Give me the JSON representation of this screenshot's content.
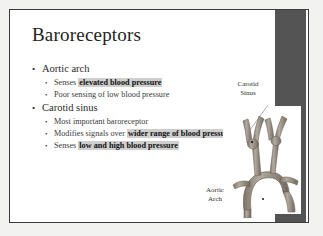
{
  "slide": {
    "title": "Baroreceptors",
    "bullets": [
      {
        "level": 1,
        "marker": "•",
        "text": "Aortic arch"
      },
      {
        "level": 2,
        "marker": "•",
        "lead": "Senses ",
        "highlight": "elevated blood  pressure",
        "tail": ""
      },
      {
        "level": 2,
        "marker": "•",
        "lead": "Poor sensing  of low blood pressure",
        "highlight": "",
        "tail": ""
      },
      {
        "level": 1,
        "marker": "•",
        "text": "Carotid sinus"
      },
      {
        "level": 2,
        "marker": "•",
        "lead": "Most important  baroreceptor",
        "highlight": "",
        "tail": ""
      },
      {
        "level": 2,
        "marker": "•",
        "lead": "Modifies signals over ",
        "highlight": "wider range of blood  pressure",
        "tail": ""
      },
      {
        "level": 2,
        "marker": "•",
        "lead": "Senses ",
        "highlight": "low and high blood  pressure",
        "tail": ""
      }
    ],
    "figure": {
      "name": "aortic-arch-carotid-anatomy-illustration",
      "labels": {
        "carotid_line1": "Carotid",
        "carotid_line2": "Sinus",
        "aortic_line1": "Aortic",
        "aortic_line2": "Arch"
      }
    },
    "colors": {
      "slide_background": "#ffffff",
      "page_background": "#f2f2f0",
      "border": "#3b3b3b",
      "band": "#545454",
      "title_text": "#231f20",
      "body_text": "#2b2b2b",
      "highlight_background": "#cfcfcf",
      "vessel": "#9a9287"
    }
  }
}
